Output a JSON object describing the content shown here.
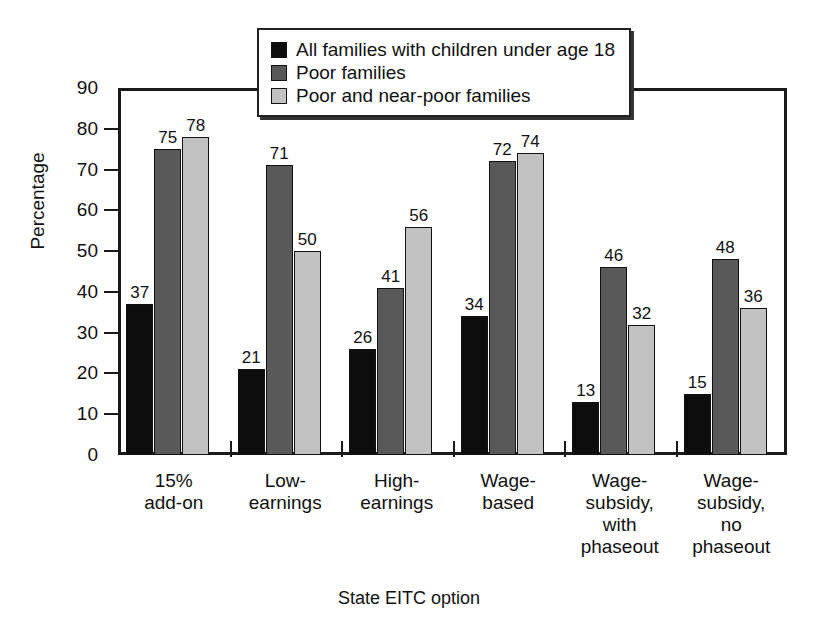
{
  "chart_data": {
    "type": "bar",
    "title": "",
    "xlabel": "State EITC option",
    "ylabel": "Percentage",
    "ylim": [
      0,
      90
    ],
    "yticks": [
      0,
      10,
      20,
      30,
      40,
      50,
      60,
      70,
      80,
      90
    ],
    "grid": false,
    "legend_position": "top-center",
    "categories": [
      "15%\nadd-on",
      "Low-\nearnings",
      "High-\nearnings",
      "Wage-\nbased",
      "Wage-\nsubsidy,\nwith\nphaseout",
      "Wage-\nsubsidy,\nno\nphaseout"
    ],
    "series": [
      {
        "name": "All families with children under age 18",
        "color": "#0d0d0d",
        "values": [
          37,
          21,
          26,
          34,
          13,
          15
        ]
      },
      {
        "name": "Poor families",
        "color": "#595959",
        "values": [
          75,
          71,
          41,
          72,
          46,
          48
        ]
      },
      {
        "name": "Poor and near-poor families",
        "color": "#c2c2c2",
        "values": [
          78,
          50,
          56,
          74,
          32,
          36
        ]
      }
    ]
  },
  "axes": {
    "y_title": "Percentage",
    "x_title": "State EITC option",
    "y_tick_labels": [
      "90",
      "80",
      "70",
      "60",
      "50",
      "40",
      "30",
      "20",
      "10",
      "0"
    ]
  },
  "legend": {
    "entries": [
      {
        "label": "All families with children under age 18",
        "color": "#0d0d0d"
      },
      {
        "label": "Poor families",
        "color": "#595959"
      },
      {
        "label": "Poor and near-poor families",
        "color": "#c2c2c2"
      }
    ]
  }
}
